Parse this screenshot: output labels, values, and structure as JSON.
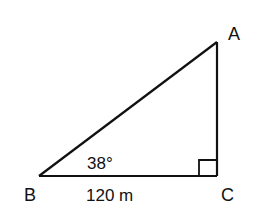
{
  "diagram": {
    "type": "right-triangle",
    "stroke_color": "#111111",
    "background": "#ffffff",
    "vertices": {
      "A": {
        "label": "A",
        "x": 217,
        "y": 42
      },
      "B": {
        "label": "B",
        "x": 39,
        "y": 176
      },
      "C": {
        "label": "C",
        "x": 217,
        "y": 176
      }
    },
    "angle_label": "38°",
    "side_label": "120 m",
    "right_angle_at": "C"
  }
}
